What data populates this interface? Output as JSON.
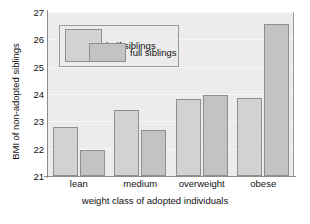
{
  "chart_data": {
    "type": "bar",
    "title": "",
    "xlabel": "weight class of adopted individuals",
    "ylabel": "BMI of non-adopted siblings",
    "categories": [
      "lean",
      "medium",
      "overweight",
      "obese"
    ],
    "series": [
      {
        "name": "half siblings",
        "values": [
          22.8,
          23.4,
          23.8,
          23.85
        ],
        "color": "#d2d2d2"
      },
      {
        "name": "full siblings",
        "values": [
          21.95,
          22.7,
          23.95,
          26.55
        ],
        "color": "#c3c3c3"
      }
    ],
    "ylim": [
      21,
      27
    ],
    "yticks": [
      21,
      22,
      23,
      24,
      25,
      26,
      27
    ],
    "ytick_labels": [
      "21",
      "22",
      "23",
      "24",
      "25",
      "26",
      "27"
    ],
    "grid": true,
    "legend_position": "top-left",
    "plot_background": "#ececec",
    "axis_color": "#8d8d8d",
    "bar_edge_color": "#8f8f8f"
  }
}
